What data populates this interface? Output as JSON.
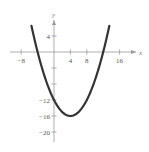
{
  "chart_data": {
    "type": "line",
    "title": "",
    "xlabel": "x",
    "ylabel": "y",
    "xlim": [
      -10,
      18
    ],
    "ylim": [
      -22,
      8
    ],
    "grid": false,
    "legend": null,
    "x_ticks": [
      -8,
      4,
      8,
      16
    ],
    "x_tick_labels": [
      "−8",
      "4",
      "8",
      "16"
    ],
    "x_minor_ticks": [
      -4,
      12
    ],
    "y_ticks": [
      4,
      -12,
      -16,
      -20
    ],
    "y_tick_labels": [
      "4",
      "−12",
      "−16",
      "−20"
    ],
    "y_minor_ticks": [
      -4,
      -8
    ],
    "series": [
      {
        "name": "parabola",
        "equation": "y = 0.25(x - 4)^2 - 16",
        "domain": [
          -5.5,
          13.5
        ],
        "color": "#333333",
        "vertex": [
          4,
          -16
        ],
        "x_intercepts": [
          -4,
          12
        ],
        "y_intercept": -12
      }
    ]
  }
}
